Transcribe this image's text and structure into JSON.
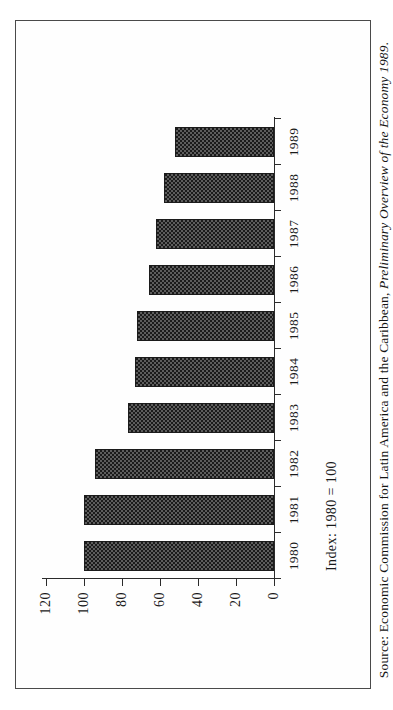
{
  "page": {
    "orientation": "landscape-rotated",
    "background_color": "#ffffff",
    "frame_color": "#4a4a4a"
  },
  "source_note": {
    "prefix": "Source: Economic Commission for Latin America and the Caribbean, ",
    "italic_title": "Preliminary Overview of the Economy 1989",
    "suffix": "."
  },
  "chart_data": {
    "type": "bar",
    "title": "",
    "subtitle": "",
    "annotation": "Index: 1980 = 100",
    "xlabel": "",
    "ylabel": "",
    "orientation": "vertical-bars-on-rotated-page",
    "grid": false,
    "legend_position": "none",
    "categories": [
      "1980",
      "1981",
      "1982",
      "1983",
      "1984",
      "1985",
      "1986",
      "1987",
      "1988",
      "1989"
    ],
    "values": [
      100,
      100,
      94,
      77,
      73,
      72,
      66,
      62,
      58,
      52
    ],
    "ylim": [
      0,
      120
    ],
    "yticks": [
      0,
      20,
      40,
      60,
      80,
      100,
      120
    ],
    "ytick_labels": [
      "0",
      "20",
      "40",
      "60",
      "80",
      "100",
      "120"
    ],
    "series": [
      {
        "name": "Index",
        "values": [
          100,
          100,
          94,
          77,
          73,
          72,
          66,
          62,
          58,
          52
        ],
        "fill": "checkerboard-hatch",
        "color": "#5d5d5d",
        "border_color": "#1b1b1b"
      }
    ]
  }
}
